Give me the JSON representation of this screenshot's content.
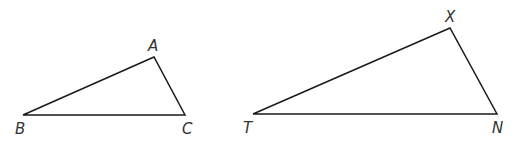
{
  "diagram": {
    "stroke_color": "#1a1a1a",
    "label_color": "#333333",
    "triangles": [
      {
        "name": "ABC",
        "vertices": [
          {
            "label": "A",
            "x": 154,
            "y": 57,
            "label_x": 148,
            "label_y": 51
          },
          {
            "label": "B",
            "x": 23,
            "y": 115,
            "label_x": 15,
            "label_y": 134
          },
          {
            "label": "C",
            "x": 185,
            "y": 115,
            "label_x": 182,
            "label_y": 134
          }
        ]
      },
      {
        "name": "TXN",
        "vertices": [
          {
            "label": "X",
            "x": 450,
            "y": 28,
            "label_x": 445,
            "label_y": 22
          },
          {
            "label": "T",
            "x": 253,
            "y": 114,
            "label_x": 243,
            "label_y": 133
          },
          {
            "label": "N",
            "x": 497,
            "y": 114,
            "label_x": 492,
            "label_y": 133
          }
        ]
      }
    ]
  }
}
